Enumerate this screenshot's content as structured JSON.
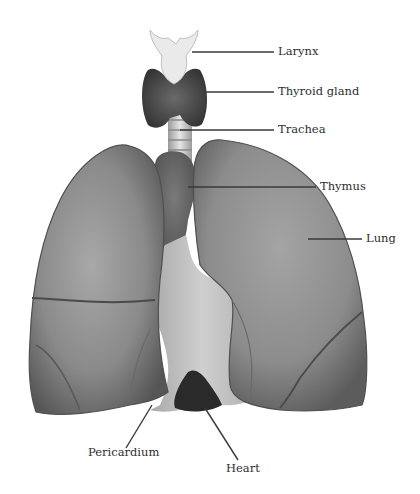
{
  "diagram": {
    "type": "anatomical-illustration",
    "labels": [
      {
        "id": "larynx",
        "text": "Larynx",
        "x": 278,
        "y": 42
      },
      {
        "id": "thyroid",
        "text": "Thyroid gland",
        "x": 278,
        "y": 83
      },
      {
        "id": "trachea",
        "text": "Trachea",
        "x": 278,
        "y": 122
      },
      {
        "id": "thymus",
        "text": "Thymus",
        "x": 320,
        "y": 180
      },
      {
        "id": "lung",
        "text": "Lung",
        "x": 366,
        "y": 234
      },
      {
        "id": "pericardium",
        "text": "Pericardium",
        "x": 110,
        "y": 448
      },
      {
        "id": "heart",
        "text": "Heart",
        "x": 218,
        "y": 468
      }
    ],
    "colors": {
      "lung_fill": "#8c8c8c",
      "lung_dark": "#5a5a5a",
      "pericardium_fill": "#c4c4c4",
      "heart_fill": "#2a2a2a",
      "thyroid_fill": "#4a4a4a",
      "larynx_fill": "#eaeaea",
      "leader_line": "#3a3a3a",
      "text": "#2e2e2e"
    }
  }
}
